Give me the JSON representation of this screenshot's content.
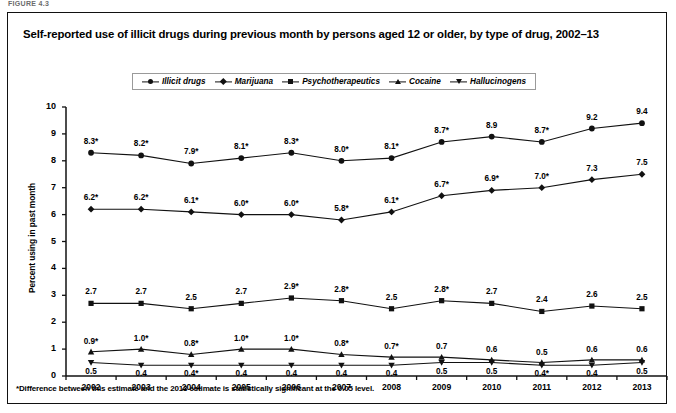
{
  "figure_label": "FIGURE 4.3",
  "title": "Self-reported use of illicit drugs during previous month by persons aged 12 or older, by type of drug, 2002–13",
  "footnote": "*Difference between this estimate and the 2013 estimate is statistically significant at the 0.05 level.",
  "legend": {
    "items": [
      {
        "label": "Illicit drugs",
        "marker": "circle"
      },
      {
        "label": "Marijuana",
        "marker": "diamond"
      },
      {
        "label": "Psychotherapeutics",
        "marker": "square"
      },
      {
        "label": "Cocaine",
        "marker": "triangle-up"
      },
      {
        "label": "Hallucinogens",
        "marker": "triangle-down"
      }
    ]
  },
  "axes": {
    "ylabel": "Percent using in past month",
    "yticks": [
      "0",
      "1",
      "2",
      "3",
      "4",
      "5",
      "6",
      "7",
      "8",
      "9",
      "10"
    ],
    "xticks": [
      "2002",
      "2003",
      "2004",
      "2005",
      "2006",
      "2007",
      "2008",
      "2009",
      "2010",
      "2011",
      "2012",
      "2013"
    ]
  },
  "chart_data": {
    "type": "line",
    "title": "Self-reported use of illicit drugs during previous month by persons aged 12 or older, by type of drug, 2002–13",
    "xlabel": "",
    "ylabel": "Percent using in past month",
    "categories": [
      "2002",
      "2003",
      "2004",
      "2005",
      "2006",
      "2007",
      "2008",
      "2009",
      "2010",
      "2011",
      "2012",
      "2013"
    ],
    "ylim": [
      0,
      10
    ],
    "grid": false,
    "legend_position": "top",
    "series": [
      {
        "name": "Illicit drugs",
        "marker": "circle",
        "values": [
          8.3,
          8.2,
          7.9,
          8.1,
          8.3,
          8.0,
          8.1,
          8.7,
          8.9,
          8.7,
          9.2,
          9.4
        ],
        "labels": [
          "8.3*",
          "8.2*",
          "7.9*",
          "8.1*",
          "8.3*",
          "8.0*",
          "8.1*",
          "8.7*",
          "8.9",
          "8.7*",
          "9.2",
          "9.4"
        ]
      },
      {
        "name": "Marijuana",
        "marker": "diamond",
        "values": [
          6.2,
          6.2,
          6.1,
          6.0,
          6.0,
          5.8,
          6.1,
          6.7,
          6.9,
          7.0,
          7.3,
          7.5
        ],
        "labels": [
          "6.2*",
          "6.2*",
          "6.1*",
          "6.0*",
          "6.0*",
          "5.8*",
          "6.1*",
          "6.7*",
          "6.9*",
          "7.0*",
          "7.3",
          "7.5"
        ]
      },
      {
        "name": "Psychotherapeutics",
        "marker": "square",
        "values": [
          2.7,
          2.7,
          2.5,
          2.7,
          2.9,
          2.8,
          2.5,
          2.8,
          2.7,
          2.4,
          2.6,
          2.5
        ],
        "labels": [
          "2.7",
          "2.7",
          "2.5",
          "2.7",
          "2.9*",
          "2.8*",
          "2.5",
          "2.8*",
          "2.7",
          "2.4",
          "2.6",
          "2.5"
        ]
      },
      {
        "name": "Cocaine",
        "marker": "triangle-up",
        "values": [
          0.9,
          1.0,
          0.8,
          1.0,
          1.0,
          0.8,
          0.7,
          0.7,
          0.6,
          0.5,
          0.6,
          0.6
        ],
        "labels": [
          "0.9*",
          "1.0*",
          "0.8*",
          "1.0*",
          "1.0*",
          "0.8*",
          "0.7*",
          "0.7",
          "0.6",
          "0.5",
          "0.6",
          "0.6"
        ]
      },
      {
        "name": "Hallucinogens",
        "marker": "triangle-down",
        "values": [
          0.5,
          0.4,
          0.4,
          0.4,
          0.4,
          0.4,
          0.4,
          0.5,
          0.5,
          0.4,
          0.4,
          0.5
        ],
        "labels": [
          "0.5",
          "0.4",
          "0.4*",
          "0.4",
          "0.4",
          "0.4",
          "0.4",
          "0.5",
          "0.5",
          "0.4*",
          "0.4",
          "0.5"
        ]
      }
    ]
  },
  "colors": {
    "ink": "#111111",
    "panel_border": "#111111",
    "legend_border": "#9a9a9a"
  }
}
